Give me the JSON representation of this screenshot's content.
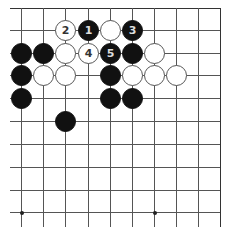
{
  "board": {
    "description": "Go board corner diagram (top-right region visible)",
    "columns_x": [
      21,
      43,
      65,
      88,
      110,
      132,
      154,
      176,
      198,
      220
    ],
    "rows_y": [
      8,
      30,
      53,
      75,
      98,
      121,
      144,
      167,
      190,
      212
    ],
    "left_extent": 10,
    "right_edge_x": 220,
    "top_edge_y": 8,
    "star_points": [
      {
        "col": 0,
        "row": 9
      },
      {
        "col": 6,
        "row": 9
      }
    ],
    "colors": {
      "black": "#111111",
      "white": "#ffffff",
      "line": "#555555"
    }
  },
  "stones": [
    {
      "color": "white",
      "col": 2,
      "row": 1,
      "label": "2"
    },
    {
      "color": "black",
      "col": 3,
      "row": 1,
      "label": "1"
    },
    {
      "color": "white",
      "col": 4,
      "row": 1,
      "label": ""
    },
    {
      "color": "black",
      "col": 5,
      "row": 1,
      "label": "3"
    },
    {
      "color": "black",
      "col": 0,
      "row": 2,
      "label": ""
    },
    {
      "color": "black",
      "col": 1,
      "row": 2,
      "label": ""
    },
    {
      "color": "white",
      "col": 2,
      "row": 2,
      "label": ""
    },
    {
      "color": "white",
      "col": 3,
      "row": 2,
      "label": "4"
    },
    {
      "color": "black",
      "col": 4,
      "row": 2,
      "label": "5"
    },
    {
      "color": "black",
      "col": 5,
      "row": 2,
      "label": ""
    },
    {
      "color": "white",
      "col": 6,
      "row": 2,
      "label": ""
    },
    {
      "color": "black",
      "col": 0,
      "row": 3,
      "label": ""
    },
    {
      "color": "white",
      "col": 1,
      "row": 3,
      "label": ""
    },
    {
      "color": "white",
      "col": 2,
      "row": 3,
      "label": ""
    },
    {
      "color": "black",
      "col": 4,
      "row": 3,
      "label": ""
    },
    {
      "color": "white",
      "col": 5,
      "row": 3,
      "label": ""
    },
    {
      "color": "white",
      "col": 6,
      "row": 3,
      "label": ""
    },
    {
      "color": "white",
      "col": 7,
      "row": 3,
      "label": ""
    },
    {
      "color": "black",
      "col": 0,
      "row": 4,
      "label": ""
    },
    {
      "color": "black",
      "col": 4,
      "row": 4,
      "label": ""
    },
    {
      "color": "black",
      "col": 5,
      "row": 4,
      "label": ""
    },
    {
      "color": "black",
      "col": 2,
      "row": 5,
      "label": ""
    }
  ]
}
